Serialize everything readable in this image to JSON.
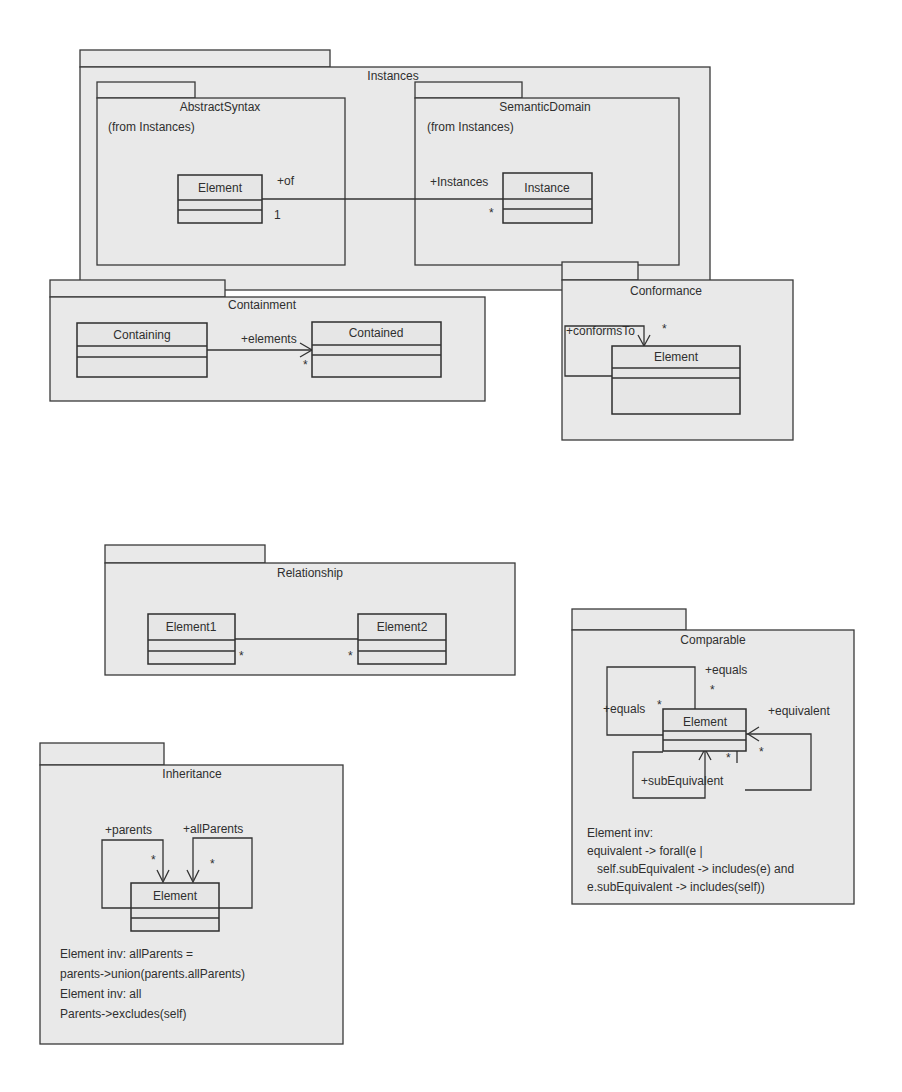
{
  "diagram": {
    "type": "UML package/class diagram",
    "packages": {
      "instances": {
        "name": "Instances",
        "subpackages": {
          "abstract_syntax": {
            "name": "AbstractSyntax",
            "from": "(from Instances)",
            "class": "Element"
          },
          "semantic_domain": {
            "name": "SemanticDomain",
            "from": "(from Instances)",
            "class": "Instance"
          }
        },
        "association": {
          "role_of": "+of",
          "mult_of": "1",
          "role_instances": "+Instances",
          "mult_instances": "*"
        }
      },
      "containment": {
        "name": "Containment",
        "class_a": "Containing",
        "class_b": "Contained",
        "role": "+elements",
        "mult": "*"
      },
      "conformance": {
        "name": "Conformance",
        "class": "Element",
        "role": "+conformsTo",
        "mult": "*"
      },
      "relationship": {
        "name": "Relationship",
        "class_a": "Element1",
        "class_b": "Element2",
        "mult_a": "*",
        "mult_b": "*"
      },
      "comparable": {
        "name": "Comparable",
        "class": "Element",
        "role_equals_top": "+equals",
        "role_equals_left": "+equals",
        "role_equivalent": "+equivalent",
        "role_sub_equivalent": "+subEquivalent",
        "mult": "*",
        "constraint": [
          "Element inv:",
          "equivalent -> forall(e |",
          "   self.subEquivalent -> includes(e) and",
          "e.subEquivalent -> includes(self))"
        ]
      },
      "inheritance": {
        "name": "Inheritance",
        "class": "Element",
        "role_parents": "+parents",
        "role_all_parents": "+allParents",
        "mult": "*",
        "constraint": [
          "Element inv: allParents =",
          "parents->union(parents.allParents)",
          "Element inv: all",
          "Parents->excludes(self)"
        ]
      }
    }
  }
}
